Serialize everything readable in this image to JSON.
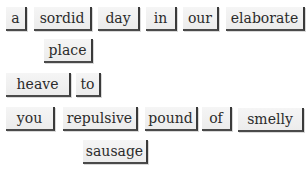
{
  "tiles": [
    {
      "word": "a",
      "x": 6,
      "y": 7,
      "w": 21
    },
    {
      "word": "sordid",
      "x": 34,
      "y": 7,
      "w": 58
    },
    {
      "word": "day",
      "x": 98,
      "y": 7,
      "w": 42
    },
    {
      "word": "in",
      "x": 146,
      "y": 7,
      "w": 31
    },
    {
      "word": "our",
      "x": 183,
      "y": 7,
      "w": 36
    },
    {
      "word": "elaborate",
      "x": 226,
      "y": 7,
      "w": 79
    },
    {
      "word": "place",
      "x": 44,
      "y": 39,
      "w": 49
    },
    {
      "word": "heave",
      "x": 6,
      "y": 73,
      "w": 65
    },
    {
      "word": "to",
      "x": 76,
      "y": 73,
      "w": 25
    },
    {
      "word": "you",
      "x": 6,
      "y": 107,
      "w": 49
    },
    {
      "word": "repulsive",
      "x": 63,
      "y": 107,
      "w": 75
    },
    {
      "word": "pound",
      "x": 145,
      "y": 107,
      "w": 53
    },
    {
      "word": "of",
      "x": 202,
      "y": 107,
      "w": 30
    },
    {
      "word": "smelly",
      "x": 238,
      "y": 108,
      "w": 66
    },
    {
      "word": "sausage",
      "x": 83,
      "y": 140,
      "w": 65
    }
  ]
}
